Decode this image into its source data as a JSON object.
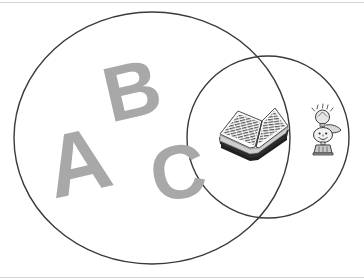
{
  "diagram": {
    "type": "venn",
    "title": "",
    "background_color": "#ffffff",
    "stroke_color": "#3a3a3a",
    "letter_color": "#a8a8a8",
    "rule_color": "#d4d4d4",
    "sets": [
      {
        "id": "letters-set",
        "label": "",
        "shape": "ellipse",
        "cx": 152,
        "cy": 138,
        "rx": 138,
        "ry": 126,
        "contents": [
          "letter-a",
          "letter-b",
          "letter-c"
        ]
      },
      {
        "id": "reading-set",
        "label": "",
        "shape": "circle",
        "cx": 268,
        "cy": 137,
        "r": 81,
        "contents": [
          "open-book-illustration",
          "idea-character-illustration"
        ]
      }
    ],
    "letters": [
      {
        "id": "letter-b",
        "char": "B",
        "x": 132,
        "y": 90,
        "rotation": -13,
        "size": 78
      },
      {
        "id": "letter-a",
        "char": "A",
        "x": 78,
        "y": 162,
        "rotation": -13,
        "size": 88
      },
      {
        "id": "letter-c",
        "char": "C",
        "x": 178,
        "y": 172,
        "rotation": -10,
        "size": 76
      }
    ],
    "illustrations": [
      {
        "id": "open-book-illustration",
        "name": "open-book",
        "description": "open book with printed text lines on both pages",
        "region": "intersection",
        "x": 218,
        "y": 107,
        "width": 72,
        "height": 58
      },
      {
        "id": "idea-character-illustration",
        "name": "idea-character",
        "description": "cartoon figure holding up a glowing lightbulb",
        "region": "reading-set-only",
        "x": 307,
        "y": 104,
        "width": 38,
        "height": 52
      }
    ],
    "rules": [
      {
        "id": "rule-top",
        "y": 2
      },
      {
        "id": "rule-bottom",
        "y": 277
      }
    ]
  }
}
